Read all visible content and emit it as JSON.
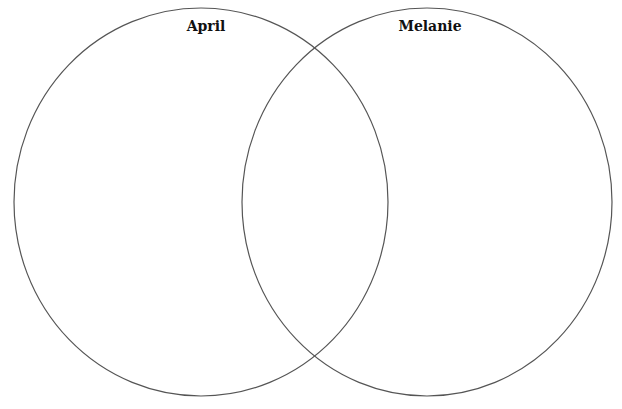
{
  "diagram": {
    "type": "venn",
    "sets": [
      {
        "label": "April",
        "cx": 201,
        "cy": 202,
        "rx": 187,
        "ry": 194,
        "label_x": 206,
        "label_y": 18
      },
      {
        "label": "Melanie",
        "cx": 427,
        "cy": 202,
        "rx": 185,
        "ry": 194,
        "label_x": 430,
        "label_y": 18
      }
    ],
    "stroke_color": "#555555",
    "stroke_width": 1.2,
    "background": "#ffffff"
  }
}
